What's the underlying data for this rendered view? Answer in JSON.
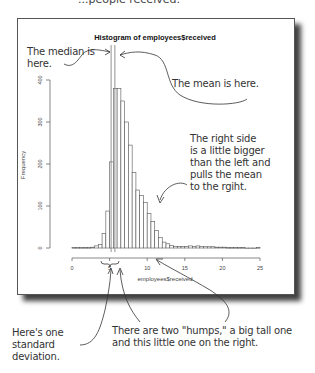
{
  "header_fragment": "...people received.",
  "chart_data": {
    "type": "bar",
    "title": "Histogram of employees$received",
    "xlabel": "employees$received",
    "ylabel": "Frequency",
    "xlim": [
      0,
      25
    ],
    "ylim": [
      0,
      400
    ],
    "x_ticks": [
      "0",
      "5",
      "10",
      "15",
      "20",
      "25"
    ],
    "y_ticks": [
      "0",
      "100",
      "200",
      "300",
      "400"
    ],
    "grid": false,
    "legend": null,
    "bin_width": 0.5,
    "bin_starts": [
      0,
      0.5,
      1,
      1.5,
      2,
      2.5,
      3,
      3.5,
      4,
      4.5,
      5,
      5.5,
      6,
      6.5,
      7,
      7.5,
      8,
      8.5,
      9,
      9.5,
      10,
      10.5,
      11,
      11.5,
      12,
      12.5,
      13,
      13.5,
      14,
      14.5,
      15,
      15.5,
      16,
      16.5,
      17,
      17.5,
      18,
      18.5,
      19,
      19.5,
      20,
      20.5,
      21,
      21.5,
      22,
      22.5,
      23,
      23.5,
      24,
      24.5
    ],
    "values": [
      1,
      1,
      1,
      1,
      1,
      2,
      5,
      8,
      35,
      88,
      205,
      380,
      380,
      350,
      300,
      245,
      180,
      138,
      125,
      108,
      82,
      63,
      42,
      25,
      14,
      10,
      6,
      4,
      4,
      4,
      4,
      5,
      4,
      5,
      4,
      3,
      3,
      3,
      2,
      2,
      2,
      1,
      1,
      1,
      1,
      1,
      0,
      0,
      0,
      1
    ],
    "median_line": 5.2,
    "mean_line": 5.7
  },
  "annotations": {
    "median": "The median is here.",
    "mean": "The mean is here.",
    "right_side": [
      "The right side",
      "is a little bigger",
      "than the left and",
      "pulls the mean",
      "to the rgiht."
    ],
    "std_dev": [
      "Here's one",
      "standard",
      "deviation."
    ],
    "humps": [
      "There are two \"humps,\" a big tall one",
      "and this little one on the right."
    ]
  },
  "colors": {
    "bar_stroke": "#555555",
    "bar_fill": "#ffffff",
    "line": "#777777",
    "text": "#333333"
  }
}
